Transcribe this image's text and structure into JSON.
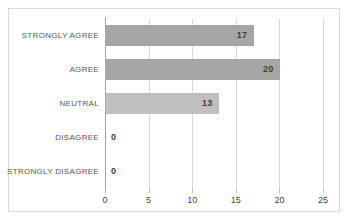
{
  "chart_data": {
    "type": "bar",
    "orientation": "horizontal",
    "title": "",
    "xlabel": "",
    "ylabel": "",
    "categories": [
      "STRONGLY AGREE",
      "AGREE",
      "NEUTRAL",
      "DISAGREE",
      "STRONGLY DISAGREE"
    ],
    "values": [
      17,
      20,
      13,
      0,
      0
    ],
    "value_labels": [
      "17",
      "20",
      "13",
      "0",
      "0"
    ],
    "bar_colors": [
      "#a6a6a6",
      "#a6a6a6",
      "#bfbfbf",
      "#a6a6a6",
      "#a6a6a6"
    ],
    "xlim": [
      0,
      25
    ],
    "xticks": [
      0,
      5,
      10,
      15,
      20,
      25
    ],
    "xtick_labels": [
      "0",
      "5",
      "10",
      "15",
      "20",
      "25"
    ],
    "grid": true,
    "grid_axis": "x",
    "legend": false,
    "legend_position": "none",
    "colors": {
      "bar_default": "#a6a6a6",
      "bar_highlight": "#bfbfbf",
      "gridline": "#d9d9d9",
      "axis_line": "#a6a6a6",
      "border": "#d9d9d9",
      "background": "#ffffff",
      "value_text": "#3f3f3f",
      "category_text": "#5a5a5a",
      "tick_text": "#444444"
    }
  }
}
